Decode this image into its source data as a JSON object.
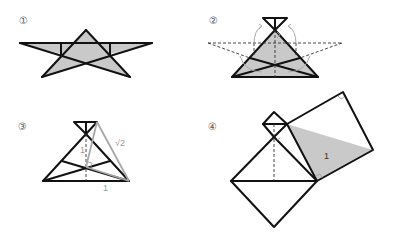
{
  "figure": {
    "steps": [
      {
        "id": 1,
        "label": "①"
      },
      {
        "id": 2,
        "label": "②"
      },
      {
        "id": 3,
        "label": "③",
        "measures": {
          "height": "1",
          "hypotenuse": "√2",
          "base": "1"
        }
      },
      {
        "id": 4,
        "label": "④",
        "measures": {
          "area": "1"
        }
      }
    ]
  },
  "colors": {
    "stroke": "#111111",
    "shade": "#c9c9c9",
    "guide": "#a8a8a8"
  }
}
